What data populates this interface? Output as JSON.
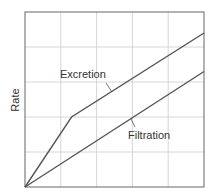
{
  "chart_data": {
    "type": "line",
    "title": "",
    "xlabel": "",
    "ylabel": "Rate",
    "xlim": [
      0,
      5
    ],
    "ylim": [
      0,
      5
    ],
    "grid": true,
    "grid_divisions": {
      "x": 5,
      "y": 5
    },
    "tick_labels": {
      "x": [],
      "y": []
    },
    "legend": "inline labels with leader lines",
    "series": [
      {
        "name": "Excretion",
        "points": [
          [
            0,
            0
          ],
          [
            1.3,
            2.0
          ],
          [
            5,
            4.4
          ]
        ],
        "color": "#555555"
      },
      {
        "name": "Filtration",
        "points": [
          [
            0,
            0
          ],
          [
            5,
            3.3
          ]
        ],
        "color": "#555555"
      }
    ]
  },
  "labels": {
    "ylabel": "Rate",
    "excretion": "Excretion",
    "filtration": "Filtration"
  },
  "colors": {
    "frame": "#666666",
    "grid": "#d6d6d6",
    "line": "#555555",
    "background": "#ffffff"
  }
}
